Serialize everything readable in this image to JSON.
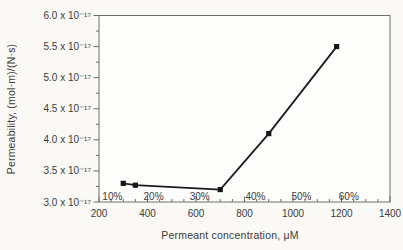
{
  "chart_data": {
    "type": "line",
    "title": "",
    "xlabel": "Permeant concentration, μM",
    "ylabel": "Permeability, (mol·m)/(N·s)",
    "xlim": [
      200,
      1400
    ],
    "ylim": [
      3.0,
      6.0
    ],
    "x_ticks": [
      200,
      400,
      600,
      800,
      1000,
      1200,
      1400
    ],
    "x_minor_step": 50,
    "y_ticks": [
      3.0,
      3.5,
      4.0,
      4.5,
      5.0,
      5.5,
      6.0
    ],
    "y_minor_step": 0.25,
    "y_tick_labels": [
      "3.0 x 10⁻¹⁷",
      "3.5 x 10⁻¹⁷",
      "4.0 x 10⁻¹⁷",
      "4.5 x 10⁻¹⁷",
      "5.0 x 10⁻¹⁷",
      "5.5 x 10⁻¹⁷",
      "6.0 x 10⁻¹⁷"
    ],
    "y_values_unit": "×10⁻¹⁷ (mol·m)/(N·s)",
    "grid": "off",
    "legend": "none",
    "series": [
      {
        "name": "permeability",
        "marker": "square",
        "x": [
          300,
          350,
          700,
          900,
          1180
        ],
        "y": [
          3.3,
          3.27,
          3.2,
          4.1,
          5.5
        ]
      }
    ],
    "annotations": [
      {
        "label": "10%",
        "x": 255
      },
      {
        "label": "20%",
        "x": 425
      },
      {
        "label": "30%",
        "x": 615
      },
      {
        "label": "40%",
        "x": 845
      },
      {
        "label": "50%",
        "x": 1035
      },
      {
        "label": "60%",
        "x": 1230
      }
    ],
    "colors": {
      "line": "#1c1c1c",
      "marker": "#161616",
      "axis": "#6e6e6e",
      "text": "#3a3a3a",
      "background": "#faf9f6",
      "plot_bg": "#fdfdfb"
    }
  }
}
